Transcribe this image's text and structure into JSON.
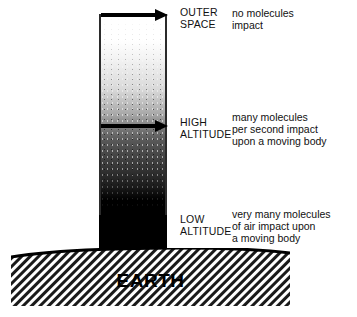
{
  "figure": {
    "earth": {
      "label": "EARTH"
    },
    "tiers": [
      {
        "id": "outer-space",
        "label": "OUTER\nSPACE",
        "description": "no molecules\nimpact",
        "arrow": "horizontal-arrow-right"
      },
      {
        "id": "high-altitude",
        "label": "HIGH\nALTITUDE",
        "description": "many molecules\nper second impact\nupon a moving body",
        "arrow": "horizontal-arrow-right"
      },
      {
        "id": "low-altitude",
        "label": "LOW\nALTITUDE",
        "description": "very many molecules\nof air impact upon\na moving body",
        "arrow": null
      }
    ],
    "colors": {
      "ink": "#000000",
      "background": "#ffffff",
      "text": "#111111",
      "column_top": "#ffffff",
      "column_bottom": "#000000"
    }
  }
}
